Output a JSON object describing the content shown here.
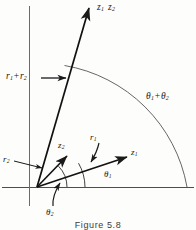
{
  "figure": {
    "caption": "Figure 5.8",
    "axes": {
      "horizontal_axis_name": "real-axis",
      "vertical_axis_name": "imaginary-axis"
    },
    "labels": {
      "product_vector": {
        "base": "z",
        "sub": "1",
        "base2": "z",
        "sub2": "2",
        "text": "z1 z2"
      },
      "radius_sum": {
        "text": "r1 + r2",
        "r1": "r",
        "sub1": "1",
        "op": "+",
        "r2": "r",
        "sub2": "2"
      },
      "angle_sum": {
        "text": "θ1 + θ2",
        "t1": "θ",
        "sub1": "1",
        "op": "+",
        "t2": "θ",
        "sub2": "2"
      },
      "z1": {
        "base": "z",
        "sub": "1"
      },
      "z2": {
        "base": "z",
        "sub": "2"
      },
      "r1": {
        "base": "r",
        "sub": "1"
      },
      "r2": {
        "base": "r",
        "sub": "2"
      },
      "theta1": {
        "base": "θ",
        "sub": "1"
      },
      "theta2": {
        "base": "θ",
        "sub": "2"
      }
    },
    "colors": {
      "ink": "#1a1a1a",
      "axis": "#4d4d4d",
      "arc": "#555555",
      "background": "#fdfdfc"
    },
    "geometry": {
      "origin": [
        37,
        187
      ],
      "product_vector_tip": [
        89,
        6
      ],
      "z1_vector_tip": [
        128,
        155
      ],
      "z2_vector_tip": [
        68,
        154
      ],
      "arc_radius_large": 150,
      "arc_radius_theta1": 48,
      "arc_radius_theta2": 30
    }
  }
}
